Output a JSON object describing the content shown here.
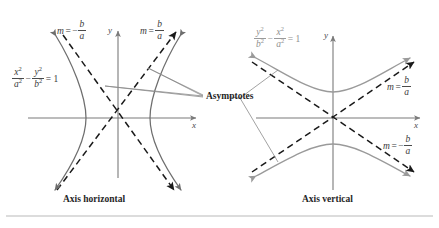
{
  "figure": {
    "background_color": "#ffffff",
    "curve_color_left": "#6e6e6e",
    "curve_color_right": "#9a9a9a",
    "asymptote_color": "#1a1a1a",
    "axis_color": "#7a7a7a",
    "leader_color": "#8a8a8a",
    "rule_color": "#b9b9b9"
  },
  "asymptotes_label": "Asymptotes",
  "left_panel": {
    "caption": "Axis horizontal",
    "equation": {
      "num1": "x",
      "den1": "a",
      "op": "−",
      "num2": "y",
      "den2": "b",
      "equals": "= 1",
      "exp": "2"
    },
    "slope_left": {
      "m": "m",
      "eq": "=",
      "sign": "−",
      "num": "b",
      "den": "a"
    },
    "slope_right": {
      "m": "m",
      "eq": "=",
      "sign": "",
      "num": "b",
      "den": "a"
    },
    "axis_x_label": "x",
    "axis_y_label": "y"
  },
  "right_panel": {
    "caption": "Axis vertical",
    "equation": {
      "num1": "y",
      "den1": "b",
      "op": "−",
      "num2": "x",
      "den2": "a",
      "equals": "= 1",
      "exp": "2"
    },
    "slope_upper": {
      "m": "m",
      "eq": "=",
      "sign": "",
      "num": "b",
      "den": "a"
    },
    "slope_lower": {
      "m": "m",
      "eq": "=",
      "sign": "−",
      "num": "b",
      "den": "a"
    },
    "axis_x_label": "x",
    "axis_y_label": "y"
  }
}
